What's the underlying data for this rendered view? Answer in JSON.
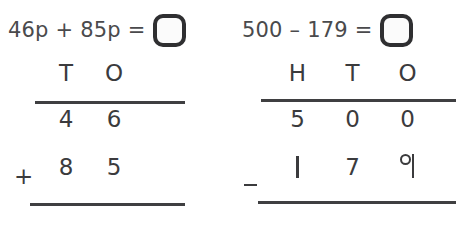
{
  "worksheet": {
    "problems": [
      {
        "id": "left",
        "equation": "46p + 85p =",
        "answer_value": "",
        "operator": "+",
        "operator_name": "plus-sign",
        "headers": [
          "T",
          "O"
        ],
        "rows": [
          {
            "name": "first-addend",
            "digits": [
              "4",
              "6"
            ]
          },
          {
            "name": "second-addend",
            "digits": [
              "8",
              "5"
            ]
          }
        ],
        "answer_row": {
          "name": "sum-row",
          "digits": [
            "",
            ""
          ]
        }
      },
      {
        "id": "right",
        "equation": "500 – 179 =",
        "answer_value": "",
        "operator": "−",
        "operator_name": "minus-sign",
        "headers": [
          "H",
          "T",
          "O"
        ],
        "rows": [
          {
            "name": "minuend",
            "digits": [
              "5",
              "0",
              "0"
            ]
          },
          {
            "name": "subtrahend",
            "digits": [
              "1",
              "7",
              "9"
            ]
          }
        ],
        "answer_row": {
          "name": "difference-row",
          "digits": [
            "",
            "",
            ""
          ]
        }
      }
    ]
  },
  "colors": {
    "ink": "#3b3b3d",
    "equation_ink": "#4a4a4c",
    "box_border": "#2f2f31",
    "rule": "#3f3f41",
    "page_background": "#ffffff"
  }
}
